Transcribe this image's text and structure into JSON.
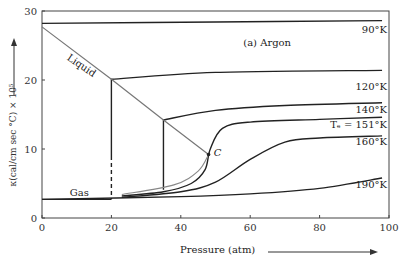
{
  "chart_data": {
    "type": "line",
    "title": "(a) Argon",
    "xlabel": "Pressure (atm)",
    "ylabel": "κ(cal/cm sec °C) × 10⁵",
    "xlim": [
      0,
      100
    ],
    "ylim": [
      0,
      30
    ],
    "xticks": [
      0,
      20,
      40,
      60,
      80,
      100
    ],
    "yticks": [
      0,
      10,
      20,
      30
    ],
    "grid": false,
    "annotations": [
      {
        "text": "Liquid",
        "x": 7,
        "y": 23
      },
      {
        "text": "Gas",
        "x": 8,
        "y": 3.2
      },
      {
        "text": "C",
        "x": 49.5,
        "y": 9
      },
      {
        "text": "(a) Argon",
        "x": 58,
        "y": 25
      }
    ],
    "series": [
      {
        "name": "90°K",
        "x": [
          0,
          50,
          98
        ],
        "y": [
          28.2,
          28.4,
          28.6
        ]
      },
      {
        "name": "120°K",
        "x": [
          20,
          20,
          50,
          98
        ],
        "y": [
          9,
          20.1,
          21.1,
          21.4
        ]
      },
      {
        "name": "140°K",
        "x": [
          35,
          35,
          50,
          70,
          98
        ],
        "y": [
          4.1,
          14.2,
          15.6,
          16.3,
          16.7
        ]
      },
      {
        "name": "Tc = 151°K",
        "x": [
          23,
          35,
          43,
          47,
          48.5,
          52,
          60,
          80,
          98
        ],
        "y": [
          3.2,
          3.8,
          5,
          7,
          10,
          13,
          13.9,
          14.3,
          14.6
        ]
      },
      {
        "name": "160°K",
        "x": [
          23,
          40,
          50,
          60,
          70,
          80,
          98
        ],
        "y": [
          3.0,
          3.8,
          5.2,
          8.5,
          11,
          11.6,
          11.9
        ]
      },
      {
        "name": "190°K",
        "x": [
          0,
          40,
          60,
          80,
          98
        ],
        "y": [
          2.7,
          3.1,
          3.5,
          4.3,
          5.8
        ]
      },
      {
        "name": "Gas",
        "x": [
          0,
          20
        ],
        "y": [
          2.7,
          2.7
        ]
      },
      {
        "name": "Liquid (saturated)",
        "x": [
          0,
          20,
          35,
          48
        ],
        "y": [
          27.7,
          20.1,
          14.2,
          9.2
        ]
      }
    ],
    "series_labels": [
      "90°K",
      "120°K",
      "140°K",
      "Tₑ = 151°K",
      "160°K",
      "190°K"
    ]
  }
}
